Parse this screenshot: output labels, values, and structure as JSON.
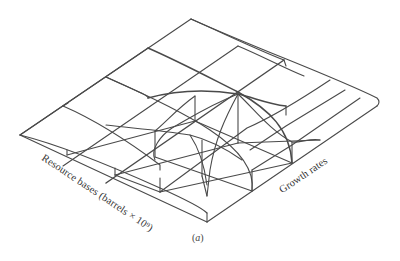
{
  "figure": {
    "type": "3d-wireframe-surface",
    "axes": {
      "front_left_label": "Resource bases (barrels × 10⁹)",
      "front_right_label": "Growth rates"
    },
    "caption_letter": "a",
    "stroke_color": "#4a4a4a"
  }
}
